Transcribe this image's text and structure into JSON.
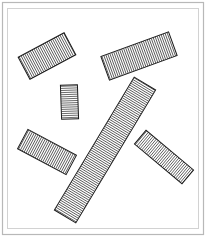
{
  "figure": {
    "canvas": {
      "width": 208,
      "height": 243
    },
    "background_color": "#ffffff",
    "frame": {
      "label": "double-line border",
      "outer": {
        "x": 2.5,
        "y": 2.5,
        "width": 201,
        "height": 232,
        "stroke": "#b8b8b8",
        "stroke_width": 1.2
      },
      "inner": {
        "x": 7.5,
        "y": 8.5,
        "width": 191,
        "height": 220,
        "stroke": "#d2d2d2",
        "stroke_width": 1
      }
    },
    "hatch": {
      "stroke": "#3c3c3c",
      "stroke_width": 0.75,
      "spacing": 2.1,
      "description": "fine parallel lines running perpendicular to each rectangle long axis"
    },
    "shape_outline": {
      "stroke": "#1a1a1a",
      "stroke_width": 1.0,
      "fill": "none"
    },
    "shapes": [
      {
        "name": "rect-top-left",
        "label": "Top-left bar",
        "center_x": 47,
        "center_y": 56,
        "length": 52,
        "thickness": 25,
        "angle_deg": -28,
        "hatch_angle_deg": 62
      },
      {
        "name": "rect-top-right",
        "label": "Top-right bar",
        "center_x": 139,
        "center_y": 56,
        "length": 72,
        "thickness": 25,
        "angle_deg": -20,
        "hatch_angle_deg": 70
      },
      {
        "name": "rect-small-center",
        "label": "Small upright bar",
        "center_x": 69.5,
        "center_y": 102,
        "length": 34,
        "thickness": 17,
        "angle_deg": 88,
        "hatch_angle_deg": -2
      },
      {
        "name": "rect-diagonal-large",
        "label": "Large diagonal bar",
        "center_x": 105,
        "center_y": 150,
        "length": 155,
        "thickness": 25,
        "angle_deg": -59,
        "hatch_angle_deg": 31
      },
      {
        "name": "rect-bottom-left",
        "label": "Bottom-left bar",
        "center_x": 47,
        "center_y": 152,
        "length": 55,
        "thickness": 22,
        "angle_deg": 28,
        "hatch_angle_deg": 118
      },
      {
        "name": "rect-right",
        "label": "Right bar",
        "center_x": 164,
        "center_y": 157,
        "length": 62,
        "thickness": 18,
        "angle_deg": 40,
        "hatch_angle_deg": 130
      }
    ]
  }
}
